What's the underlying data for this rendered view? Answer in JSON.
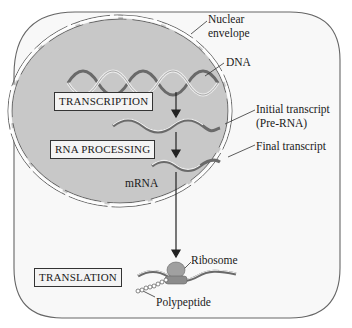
{
  "diagram": {
    "labels": {
      "nuclear_envelope_line1": "Nuclear",
      "nuclear_envelope_line2": "envelope",
      "dna": "DNA",
      "initial_transcript_line1": "Initial transcript",
      "initial_transcript_line2": "(Pre-RNA)",
      "final_transcript": "Final transcript",
      "mrna": "mRNA",
      "ribosome": "Ribosome",
      "polypeptide": "Polypeptide"
    },
    "steps": [
      {
        "label": "TRANSCRIPTION"
      },
      {
        "label": "RNA PROCESSING"
      },
      {
        "label": "TRANSLATION"
      }
    ],
    "colors": {
      "nucleus_fill": "#c9c9c9",
      "cytoplasm_fill": "#f7f7f7",
      "outline": "#555555",
      "strand_dark": "#6e6e6e",
      "strand_light": "#e8e8e8",
      "ribosome": "#9a9a9a"
    }
  }
}
